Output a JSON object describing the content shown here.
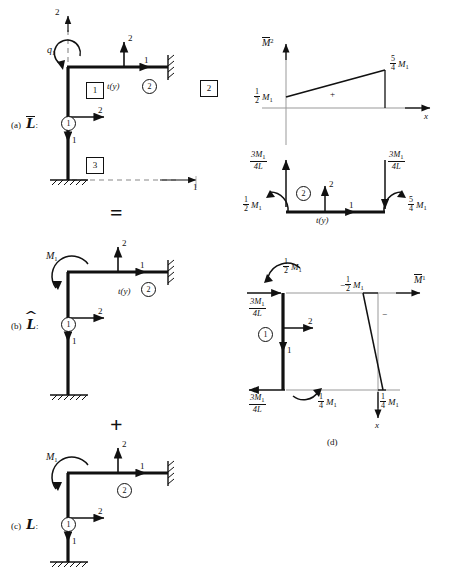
{
  "figure": {
    "caption_d": "(d)",
    "operators": {
      "equals": "=",
      "plus": "+"
    }
  },
  "panels": {
    "a": {
      "tag": "(a)",
      "symbol": "L",
      "symbol_decoration": "overbar",
      "colon": ":",
      "global_axis_vertical": "2",
      "global_axis_horizontal": "1",
      "applied_load": "q",
      "applied_load_sub": "1",
      "distributed_load": "t(y)",
      "joint_axis_top_vertical": "2",
      "joint_axis_top_horizontal": "1",
      "joint_axis_mid_vertical": "1",
      "joint_axis_mid_horizontal": "2",
      "elements": [
        {
          "name": "element-1",
          "label": "1"
        },
        {
          "name": "element-2",
          "label": "2"
        }
      ],
      "nodes": [
        {
          "name": "node-1",
          "label": "1"
        },
        {
          "name": "node-2",
          "label": "2"
        },
        {
          "name": "node-3",
          "label": "3"
        }
      ]
    },
    "b": {
      "tag": "(b)",
      "symbol": "L",
      "symbol_decoration": "hat",
      "colon": ":",
      "moment": "M",
      "moment_sub": "1",
      "distributed_load": "t(y)",
      "joint_axis_top_vertical": "2",
      "joint_axis_top_horizontal": "1",
      "joint_axis_mid_vertical": "1",
      "joint_axis_mid_horizontal": "2",
      "elements": [
        {
          "name": "element-1",
          "label": "1"
        },
        {
          "name": "element-2",
          "label": "2"
        }
      ]
    },
    "c": {
      "tag": "(c)",
      "symbol": "L",
      "symbol_decoration": "none",
      "colon": ":",
      "moment": "M",
      "moment_sub": "1",
      "joint_axis_top_vertical": "2",
      "joint_axis_top_horizontal": "1",
      "joint_axis_mid_vertical": "1",
      "joint_axis_mid_horizontal": "2",
      "elements": [
        {
          "name": "element-1",
          "label": "1"
        },
        {
          "name": "element-2",
          "label": "2"
        }
      ]
    },
    "top_right": {
      "diagram_label": "M",
      "diagram_label_sup": "2",
      "diagram_label_decoration": "overbar",
      "axis_x": "x",
      "sign_region": "+",
      "value_left": {
        "num": "1",
        "den": "2",
        "var": "M",
        "sub": "1"
      },
      "value_right": {
        "num": "5",
        "den": "4",
        "var": "M",
        "sub": "1"
      },
      "reaction_left": {
        "num": "3M",
        "num_sub": "1",
        "den": "4L"
      },
      "reaction_right": {
        "num": "3M",
        "num_sub": "1",
        "den": "4L"
      },
      "moment_left": {
        "num": "1",
        "den": "2",
        "var": "M",
        "sub": "1"
      },
      "moment_right": {
        "num": "5",
        "den": "4",
        "var": "M",
        "sub": "1"
      },
      "element_label": "2",
      "distributed_load": "t(y)",
      "local_axis_vertical": "2",
      "local_axis_horizontal": "1"
    },
    "d": {
      "diagram_label": "M",
      "diagram_label_sup": "1",
      "diagram_label_decoration": "overbar",
      "axis_x": "x",
      "sign_region": "−",
      "value_top": {
        "sign": "−",
        "num": "1",
        "den": "2",
        "var": "M",
        "sub": "1"
      },
      "value_bottom": {
        "num": "1",
        "den": "4",
        "var": "M",
        "sub": "1"
      },
      "moment_top": {
        "num": "1",
        "den": "2",
        "var": "M",
        "sub": "1"
      },
      "moment_bottom": {
        "num": "1",
        "den": "4",
        "var": "M",
        "sub": "1"
      },
      "reaction_top": {
        "num": "3M",
        "num_sub": "1",
        "den": "4L"
      },
      "reaction_bottom": {
        "num": "3M",
        "num_sub": "1",
        "den": "4L"
      },
      "element_label": "1",
      "local_axis_vertical": "1",
      "local_axis_horizontal": "2"
    }
  }
}
